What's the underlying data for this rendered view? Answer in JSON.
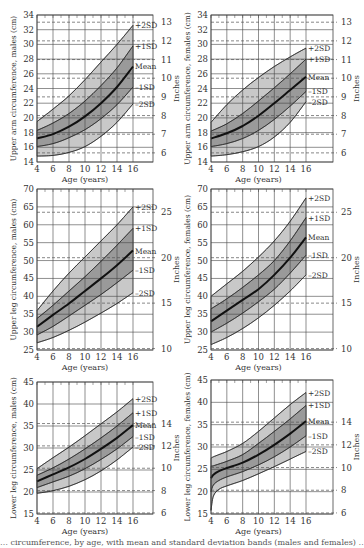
{
  "figure": {
    "caption_fragment": "… circumference, by age, with mean and standard deviation bands (males and females) …"
  },
  "style": {
    "band_outer": "#c8c8c8",
    "band_inner": "#9a9a9a",
    "band_core": "#7f7f7f",
    "mean_line": "#111111",
    "grid": "#444444",
    "dashed": "#555555"
  },
  "chart_data": [
    {
      "id": "upper-arm-males",
      "type": "area",
      "title": "",
      "xlabel": "Age (years)",
      "ylabel": "Upper arm circumference, males (cm)",
      "y2label": "Inches",
      "x": [
        4,
        6,
        8,
        10,
        12,
        14,
        16
      ],
      "xlim": [
        4,
        16
      ],
      "ylim": [
        14,
        34
      ],
      "yticks": [
        14,
        16,
        18,
        20,
        22,
        24,
        26,
        28,
        30,
        32,
        34
      ],
      "y2ticks": [
        6,
        7,
        8,
        9,
        10,
        11,
        12,
        13
      ],
      "series": [
        {
          "name": "+2SD",
          "values": [
            19.5,
            21.2,
            23.0,
            25.2,
            27.6,
            30.0,
            32.6
          ]
        },
        {
          "name": "+1SD",
          "values": [
            18.3,
            19.3,
            20.6,
            22.3,
            24.4,
            26.8,
            29.8
          ]
        },
        {
          "name": "Mean",
          "values": [
            17.2,
            17.8,
            18.8,
            20.2,
            22.0,
            24.2,
            27.0
          ]
        },
        {
          "name": "-1SD",
          "values": [
            16.1,
            16.5,
            17.3,
            18.4,
            19.9,
            21.8,
            24.2
          ]
        },
        {
          "name": "-2SD",
          "values": [
            14.8,
            14.9,
            15.3,
            16.1,
            17.5,
            19.4,
            21.9
          ]
        }
      ]
    },
    {
      "id": "upper-arm-females",
      "type": "area",
      "xlabel": "Age (years)",
      "ylabel": "Upper arm circumference, females (cm)",
      "y2label": "Inches",
      "x": [
        4,
        6,
        8,
        10,
        12,
        14,
        16
      ],
      "xlim": [
        4,
        16
      ],
      "ylim": [
        14,
        34
      ],
      "yticks": [
        14,
        16,
        18,
        20,
        22,
        24,
        26,
        28,
        30,
        32,
        34
      ],
      "y2ticks": [
        6,
        7,
        8,
        9,
        10,
        11,
        12,
        13
      ],
      "series": [
        {
          "name": "+2SD",
          "values": [
            19.4,
            21.8,
            23.8,
            25.5,
            27.0,
            28.3,
            29.5
          ]
        },
        {
          "name": "+1SD",
          "values": [
            18.2,
            19.2,
            20.6,
            22.3,
            24.1,
            26.0,
            28.0
          ]
        },
        {
          "name": "Mean",
          "values": [
            17.2,
            17.9,
            18.9,
            20.3,
            22.0,
            23.8,
            25.6
          ]
        },
        {
          "name": "-1SD",
          "values": [
            16.1,
            16.5,
            17.2,
            18.3,
            19.8,
            21.6,
            23.6
          ]
        },
        {
          "name": "-2SD",
          "values": [
            14.8,
            15.0,
            15.4,
            16.1,
            17.4,
            19.4,
            22.2
          ]
        }
      ]
    },
    {
      "id": "upper-leg-males",
      "type": "area",
      "xlabel": "Age (years)",
      "ylabel": "Upper leg circumference, males (cm)",
      "y2label": "Inches",
      "x": [
        4,
        6,
        8,
        10,
        12,
        14,
        16
      ],
      "xlim": [
        4,
        16
      ],
      "ylim": [
        25,
        70
      ],
      "yticks": [
        25,
        30,
        35,
        40,
        45,
        50,
        55,
        60,
        65,
        70
      ],
      "y2ticks": [
        10,
        15,
        20,
        25
      ],
      "series": [
        {
          "name": "+2SD",
          "values": [
            36.0,
            41.5,
            46.5,
            51.0,
            55.5,
            60.0,
            65.0
          ]
        },
        {
          "name": "+1SD",
          "values": [
            33.8,
            37.5,
            41.5,
            45.5,
            49.8,
            54.3,
            59.0
          ]
        },
        {
          "name": "Mean",
          "values": [
            31.5,
            34.8,
            38.0,
            41.5,
            45.0,
            48.7,
            52.8
          ]
        },
        {
          "name": "-1SD",
          "values": [
            29.2,
            31.6,
            34.5,
            37.5,
            40.5,
            43.8,
            47.3
          ]
        },
        {
          "name": "-2SD",
          "values": [
            27.0,
            28.5,
            30.5,
            32.8,
            35.3,
            38.0,
            41.0
          ]
        }
      ]
    },
    {
      "id": "upper-leg-females",
      "type": "area",
      "xlabel": "Age (years)",
      "ylabel": "Upper leg circumference, females (cm)",
      "y2label": "Inches",
      "x": [
        4,
        6,
        8,
        10,
        12,
        14,
        16
      ],
      "xlim": [
        4,
        16
      ],
      "ylim": [
        25,
        70
      ],
      "yticks": [
        25,
        30,
        35,
        40,
        45,
        50,
        55,
        60,
        65,
        70
      ],
      "y2ticks": [
        10,
        15,
        20,
        25
      ],
      "series": [
        {
          "name": "+2SD",
          "values": [
            40.0,
            43.5,
            47.0,
            51.0,
            55.5,
            61.0,
            67.5
          ]
        },
        {
          "name": "+1SD",
          "values": [
            36.5,
            39.3,
            42.5,
            46.0,
            50.0,
            55.5,
            62.0
          ]
        },
        {
          "name": "Mean",
          "values": [
            33.0,
            36.0,
            39.0,
            42.0,
            46.0,
            50.8,
            56.5
          ]
        },
        {
          "name": "-1SD",
          "values": [
            30.0,
            32.5,
            35.3,
            38.5,
            42.0,
            46.5,
            51.5
          ]
        },
        {
          "name": "-2SD",
          "values": [
            26.5,
            28.5,
            31.0,
            34.0,
            37.5,
            41.5,
            46.0
          ]
        }
      ]
    },
    {
      "id": "lower-leg-males",
      "type": "area",
      "xlabel": "Age (years)",
      "ylabel": "Lower leg circumference, males (cm)",
      "y2label": "Inches",
      "x": [
        4,
        6,
        8,
        10,
        12,
        14,
        16
      ],
      "xlim": [
        4,
        16
      ],
      "ylim": [
        15,
        45
      ],
      "yticks": [
        15,
        20,
        25,
        30,
        35,
        40,
        45
      ],
      "y2ticks": [
        6,
        8,
        10,
        12,
        14,
        18
      ],
      "series": [
        {
          "name": "+2SD",
          "values": [
            25.3,
            27.8,
            30.2,
            32.8,
            35.5,
            38.2,
            41.2
          ]
        },
        {
          "name": "+1SD",
          "values": [
            23.8,
            25.5,
            27.5,
            29.8,
            32.3,
            35.0,
            38.0
          ]
        },
        {
          "name": "Mean",
          "values": [
            22.4,
            24.0,
            25.6,
            27.5,
            29.8,
            32.3,
            35.2
          ]
        },
        {
          "name": "-1SD",
          "values": [
            21.0,
            22.3,
            23.6,
            25.3,
            27.4,
            29.8,
            32.6
          ]
        },
        {
          "name": "-2SD",
          "values": [
            19.7,
            20.3,
            21.3,
            22.8,
            24.8,
            27.3,
            30.2
          ]
        }
      ]
    },
    {
      "id": "lower-leg-females",
      "type": "area",
      "xlabel": "Age (years)",
      "ylabel": "Lower leg circumference, females (cm)",
      "y2label": "Inches",
      "x": [
        4,
        4.3,
        5,
        6,
        8,
        10,
        12,
        14,
        16
      ],
      "xlim": [
        4,
        16
      ],
      "ylim": [
        15,
        45
      ],
      "yticks": [
        15,
        20,
        25,
        30,
        35,
        40,
        45
      ],
      "y2ticks": [
        6,
        8,
        10,
        12,
        14,
        18
      ],
      "series": [
        {
          "name": "+2SD",
          "values": [
            27.5,
            27.8,
            28.3,
            29.0,
            30.8,
            33.5,
            36.5,
            39.5,
            42.2
          ]
        },
        {
          "name": "+1SD",
          "values": [
            25.7,
            25.8,
            26.2,
            26.8,
            28.3,
            30.8,
            33.5,
            36.3,
            39.3
          ]
        },
        {
          "name": "Mean",
          "values": [
            23.0,
            23.8,
            24.6,
            25.3,
            26.5,
            28.3,
            30.5,
            33.0,
            35.8
          ]
        },
        {
          "name": "-1SD",
          "values": [
            20.0,
            21.5,
            22.5,
            23.3,
            24.5,
            26.0,
            27.8,
            30.0,
            32.5
          ]
        },
        {
          "name": "-2SD",
          "values": [
            15.8,
            19.0,
            20.5,
            21.3,
            22.5,
            24.0,
            25.6,
            27.3,
            29.0
          ]
        }
      ]
    }
  ],
  "panels": [
    {
      "left": 37,
      "top": 15,
      "right": 153,
      "bottom": 162,
      "xmaxpx": 133,
      "labelsRight": true,
      "inchesAxisX": 153
    },
    {
      "left": 211,
      "top": 15,
      "right": 333,
      "bottom": 162,
      "xmaxpx": 306,
      "labelsRight": true,
      "inchesAxisX": 333
    },
    {
      "left": 37,
      "top": 189,
      "right": 153,
      "bottom": 350,
      "xmaxpx": 133,
      "labelsRight": true,
      "inchesAxisX": 153
    },
    {
      "left": 211,
      "top": 189,
      "right": 333,
      "bottom": 350,
      "xmaxpx": 306,
      "labelsRight": true,
      "inchesAxisX": 333
    },
    {
      "left": 37,
      "top": 382,
      "right": 153,
      "bottom": 514,
      "xmaxpx": 133,
      "labelsRight": true,
      "inchesAxisX": 153
    },
    {
      "left": 211,
      "top": 380,
      "right": 333,
      "bottom": 514,
      "xmaxpx": 306,
      "labelsRight": true,
      "inchesAxisX": 333
    }
  ]
}
